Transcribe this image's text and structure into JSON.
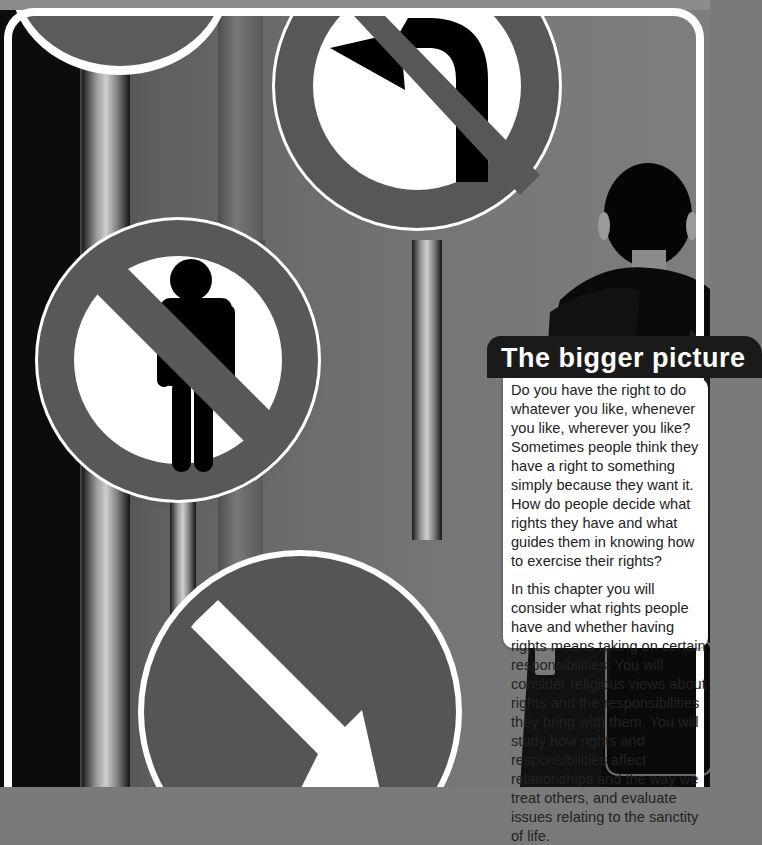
{
  "page": {
    "section_title": "The bigger picture",
    "paragraphs": [
      "Do you have the right to do whatever you like, whenever you like, wherever you like? Sometimes people think they have a right to something simply because they want it. How do people decide what rights they have and what guides them in knowing how to exercise their rights?",
      "In this chapter you will consider what rights people have and whether having rights means taking on certain responsibilities. You will consider religious views about rights and the responsibilities they bring with them. You will study how rights and responsibilities affect relationships and the way we treat others, and evaluate issues relating to the sanctity of life."
    ]
  },
  "illustration": {
    "signs": [
      {
        "name": "no-entry-partial-sign",
        "symbol": "none"
      },
      {
        "name": "no-left-turn-sign",
        "symbol": "left-turn-arrow"
      },
      {
        "name": "no-pedestrians-sign",
        "symbol": "person"
      },
      {
        "name": "keep-right-sign",
        "symbol": "diagonal-arrow"
      }
    ],
    "figure": "person-from-behind"
  },
  "colors": {
    "sign_ring": "#5a5a5a",
    "sign_face": "#ffffff",
    "title_tab": "#1a1a1a",
    "card": "#ffffff"
  }
}
